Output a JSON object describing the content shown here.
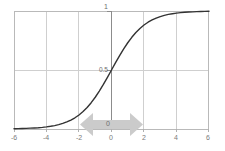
{
  "chart_data": {
    "type": "line",
    "title": "",
    "subtitle": "",
    "xlabel": "",
    "ylabel": "",
    "xlim": [
      -6,
      6
    ],
    "ylim": [
      0,
      1
    ],
    "grid": true,
    "legend": null,
    "legend_position": "none",
    "x_ticks": [
      -6,
      -4,
      -2,
      0,
      2,
      4,
      6
    ],
    "x_tick_labels": [
      "-6",
      "-4",
      "-2",
      "0",
      "2",
      "4",
      "6"
    ],
    "y_ticks": [
      0,
      0.5,
      1
    ],
    "y_tick_labels": [
      "0",
      "0.5",
      "1"
    ],
    "gridlines_x": [
      -4,
      -2,
      0,
      2,
      4
    ],
    "gridlines_y": [
      0.5
    ],
    "series": [
      {
        "name": "sigmoid",
        "color": "#333333",
        "x": [
          -6,
          -5.75,
          -5.5,
          -5.25,
          -5,
          -4.75,
          -4.5,
          -4.25,
          -4,
          -3.75,
          -3.5,
          -3.25,
          -3,
          -2.75,
          -2.5,
          -2.25,
          -2,
          -1.75,
          -1.5,
          -1.25,
          -1,
          -0.75,
          -0.5,
          -0.25,
          0,
          0.25,
          0.5,
          0.75,
          1,
          1.25,
          1.5,
          1.75,
          2,
          2.25,
          2.5,
          2.75,
          3,
          3.25,
          3.5,
          3.75,
          4,
          4.25,
          4.5,
          4.75,
          5,
          5.25,
          5.5,
          5.75,
          6
        ],
        "y": [
          0.002,
          0.003,
          0.004,
          0.005,
          0.007,
          0.009,
          0.011,
          0.014,
          0.018,
          0.023,
          0.029,
          0.037,
          0.047,
          0.06,
          0.076,
          0.095,
          0.119,
          0.148,
          0.182,
          0.223,
          0.269,
          0.321,
          0.378,
          0.438,
          0.5,
          0.562,
          0.622,
          0.679,
          0.731,
          0.777,
          0.818,
          0.852,
          0.881,
          0.905,
          0.924,
          0.94,
          0.953,
          0.963,
          0.971,
          0.977,
          0.982,
          0.986,
          0.989,
          0.991,
          0.993,
          0.995,
          0.996,
          0.997,
          0.998
        ]
      }
    ],
    "annotations": [
      {
        "name": "horizontal-double-arrow",
        "kind": "double-headed-arrow",
        "orientation": "horizontal",
        "color": "#cccccc",
        "center_x": 0,
        "span_x": [
          -1.9,
          1.9
        ]
      }
    ]
  },
  "axis_colors": {
    "frame": "#b9b9b9",
    "grid": "#cfcfcf",
    "zero_axis": "#8c8c8c",
    "curve": "#333333",
    "tick_label": "#7b7b7b",
    "arrow": "#cccccc"
  }
}
